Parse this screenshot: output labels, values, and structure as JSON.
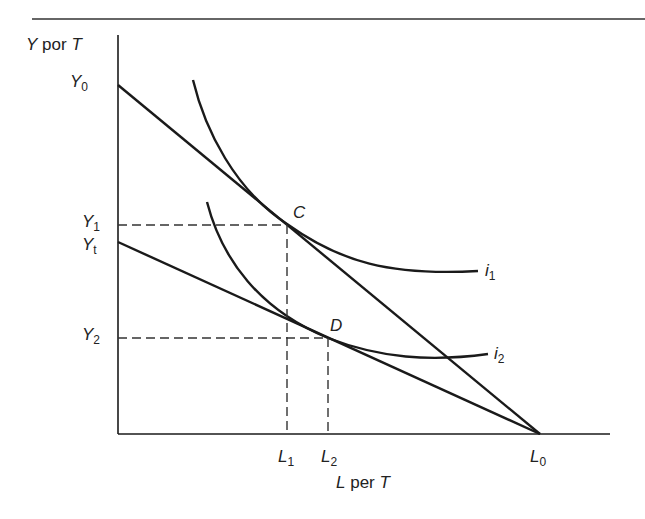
{
  "diagram": {
    "y_axis": {
      "label_var": "Y",
      "label_word": "por",
      "label_unit": "T"
    },
    "x_axis": {
      "label_var": "L",
      "label_word": "per",
      "label_unit": "T"
    },
    "y_ticks": [
      {
        "var": "Y",
        "sub": "0"
      },
      {
        "var": "Y",
        "sub": "1"
      },
      {
        "var": "Y",
        "sub": "t"
      },
      {
        "var": "Y",
        "sub": "2"
      }
    ],
    "x_ticks": [
      {
        "var": "L",
        "sub": "1"
      },
      {
        "var": "L",
        "sub": "2"
      },
      {
        "var": "L",
        "sub": "0"
      }
    ],
    "points": {
      "c": "C",
      "d": "D"
    },
    "curves": [
      {
        "var": "i",
        "sub": "1"
      },
      {
        "var": "i",
        "sub": "2"
      }
    ],
    "colors": {
      "ink": "#1a1a1a",
      "dash": "#333333"
    }
  }
}
